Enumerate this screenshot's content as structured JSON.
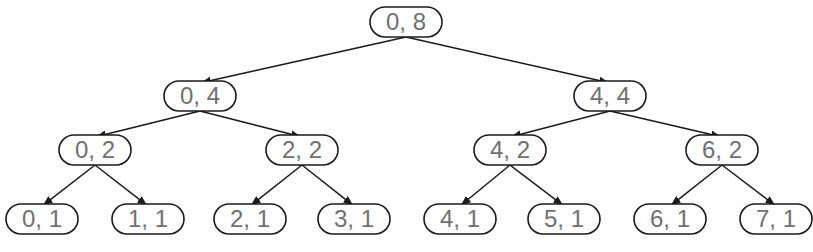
{
  "diagram": {
    "type": "binary-tree",
    "node_size": {
      "w": 72,
      "h": 30
    },
    "colors": {
      "stroke": "#1a1a1a",
      "text": "#707070",
      "fill": "#ffffff"
    },
    "nodes": [
      {
        "id": "n08",
        "label": "0, 8",
        "cx": 406,
        "cy": 22
      },
      {
        "id": "n04",
        "label": "0, 4",
        "cx": 200,
        "cy": 96
      },
      {
        "id": "n44",
        "label": "4, 4",
        "cx": 610,
        "cy": 96
      },
      {
        "id": "n02",
        "label": "0, 2",
        "cx": 95,
        "cy": 150
      },
      {
        "id": "n22",
        "label": "2, 2",
        "cx": 302,
        "cy": 150
      },
      {
        "id": "n42",
        "label": "4, 2",
        "cx": 510,
        "cy": 150
      },
      {
        "id": "n62",
        "label": "6, 2",
        "cx": 722,
        "cy": 150
      },
      {
        "id": "n01",
        "label": "0, 1",
        "cx": 42,
        "cy": 219
      },
      {
        "id": "n11",
        "label": "1, 1",
        "cx": 148,
        "cy": 219
      },
      {
        "id": "n21",
        "label": "2, 1",
        "cx": 250,
        "cy": 219
      },
      {
        "id": "n31",
        "label": "3, 1",
        "cx": 354,
        "cy": 219
      },
      {
        "id": "n41",
        "label": "4, 1",
        "cx": 460,
        "cy": 219
      },
      {
        "id": "n51",
        "label": "5, 1",
        "cx": 564,
        "cy": 219
      },
      {
        "id": "n61",
        "label": "6, 1",
        "cx": 670,
        "cy": 219
      },
      {
        "id": "n71",
        "label": "7, 1",
        "cx": 776,
        "cy": 219
      }
    ],
    "edges": [
      [
        "n08",
        "n04"
      ],
      [
        "n08",
        "n44"
      ],
      [
        "n04",
        "n02"
      ],
      [
        "n04",
        "n22"
      ],
      [
        "n44",
        "n42"
      ],
      [
        "n44",
        "n62"
      ],
      [
        "n02",
        "n01"
      ],
      [
        "n02",
        "n11"
      ],
      [
        "n22",
        "n21"
      ],
      [
        "n22",
        "n31"
      ],
      [
        "n42",
        "n41"
      ],
      [
        "n42",
        "n51"
      ],
      [
        "n62",
        "n61"
      ],
      [
        "n62",
        "n71"
      ]
    ]
  }
}
